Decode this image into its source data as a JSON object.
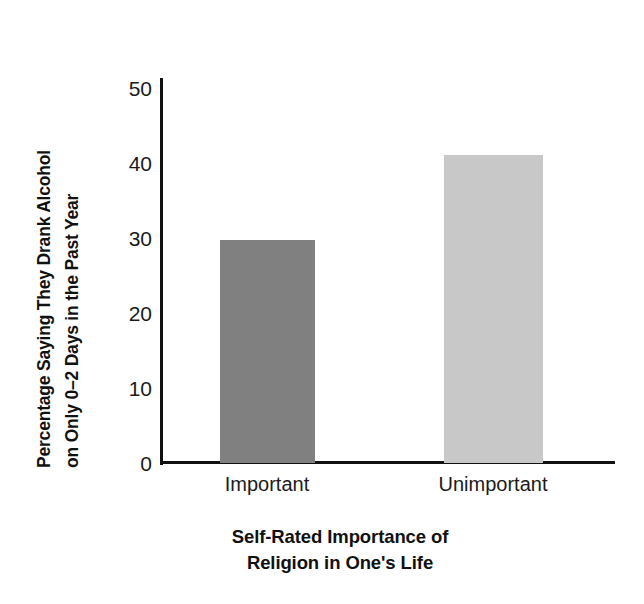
{
  "chart_data": {
    "type": "bar",
    "title": "",
    "subtitle": "",
    "categories": [
      "Important",
      "Unimportant"
    ],
    "values": [
      29,
      40
    ],
    "series": [
      {
        "name": "Percentage Saying They Drank Alcohol on Only 0–2 Days in the Past Year",
        "values": [
          29,
          40
        ]
      }
    ],
    "xlabel_line1": "Self-Rated Importance of",
    "xlabel_line2": "Religion in One's Life",
    "ylabel_line1": "Percentage Saying They Drank Alcohol",
    "ylabel_line2": "on Only 0–2 Days in the Past Year",
    "ylim": [
      0,
      50
    ],
    "yticks": [
      "0",
      "10",
      "20",
      "30",
      "40",
      "50"
    ],
    "ytick_values": [
      0,
      10,
      20,
      30,
      40,
      50
    ],
    "grid": false,
    "legend": "none",
    "bar_colors": [
      "#808080",
      "#c8c8c8"
    ],
    "axis_color": "#111111",
    "background": "#ffffff"
  }
}
